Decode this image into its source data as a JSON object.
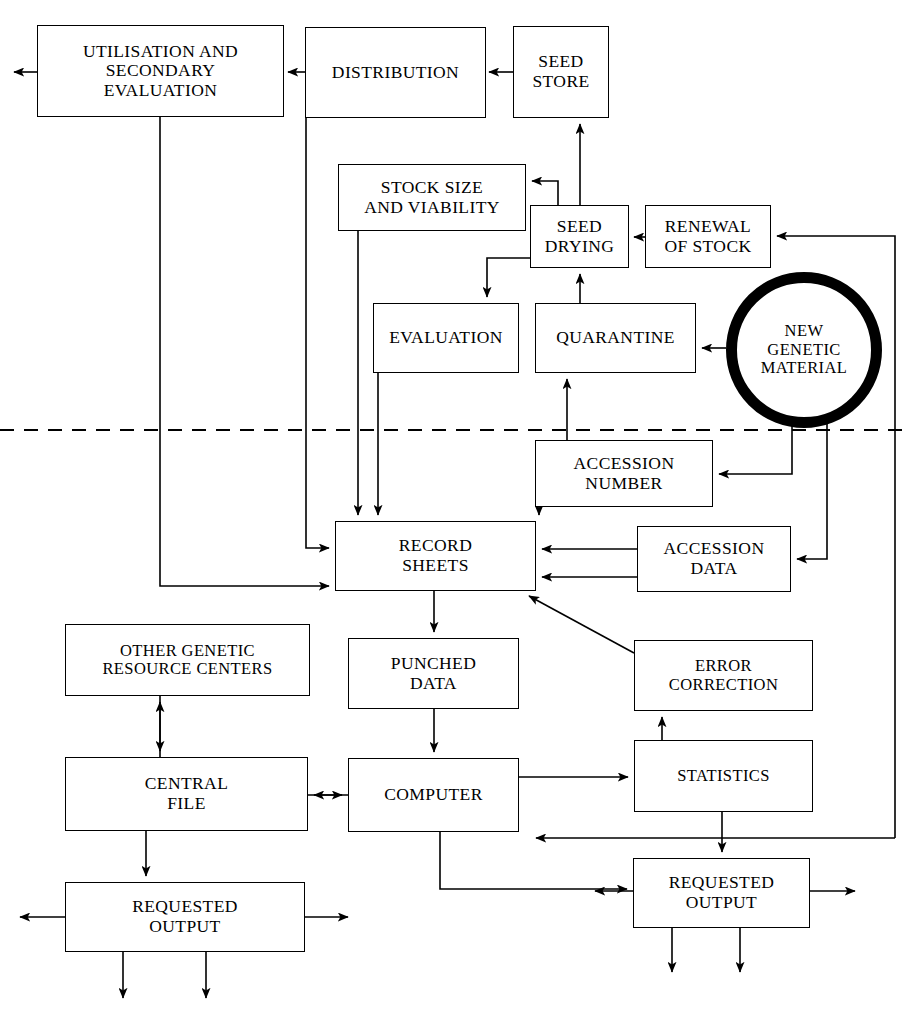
{
  "diagram": {
    "divider": {
      "name": "dashed-divider",
      "style": "dashed",
      "y": 430
    },
    "nodes": [
      {
        "id": "utilisation",
        "label": "UTILISATION AND\nSECONDARY\nEVALUATION",
        "shape": "rect",
        "x": 37,
        "y": 25,
        "w": 247,
        "h": 92
      },
      {
        "id": "distribution",
        "label": "DISTRIBUTION",
        "shape": "rect",
        "x": 305,
        "y": 27,
        "w": 181,
        "h": 91
      },
      {
        "id": "seed-store",
        "label": "SEED\nSTORE",
        "shape": "rect",
        "x": 513,
        "y": 26,
        "w": 96,
        "h": 92
      },
      {
        "id": "stock-size",
        "label": "STOCK SIZE\nAND VIABILITY",
        "shape": "rect",
        "x": 338,
        "y": 164,
        "w": 188,
        "h": 67
      },
      {
        "id": "seed-drying",
        "label": "SEED\nDRYING",
        "shape": "rect",
        "x": 530,
        "y": 205,
        "w": 99,
        "h": 63
      },
      {
        "id": "renewal-of-stock",
        "label": "RENEWAL\nOF STOCK",
        "shape": "rect",
        "x": 645,
        "y": 205,
        "w": 126,
        "h": 63
      },
      {
        "id": "evaluation",
        "label": "EVALUATION",
        "shape": "rect",
        "x": 373,
        "y": 303,
        "w": 146,
        "h": 70
      },
      {
        "id": "quarantine",
        "label": "QUARANTINE",
        "shape": "rect",
        "x": 535,
        "y": 303,
        "w": 161,
        "h": 70
      },
      {
        "id": "new-genetic-material",
        "label": "NEW\nGENETIC\nMATERIAL",
        "shape": "circle",
        "x": 726,
        "y": 272,
        "w": 156,
        "h": 156
      },
      {
        "id": "accession-number",
        "label": "ACCESSION\nNUMBER",
        "shape": "rect",
        "x": 535,
        "y": 440,
        "w": 178,
        "h": 67
      },
      {
        "id": "record-sheets",
        "label": "RECORD\nSHEETS",
        "shape": "rect",
        "x": 335,
        "y": 521,
        "w": 201,
        "h": 70
      },
      {
        "id": "accession-data",
        "label": "ACCESSION\nDATA",
        "shape": "rect",
        "x": 637,
        "y": 526,
        "w": 154,
        "h": 66
      },
      {
        "id": "other-genetic-resource-centers",
        "label": "OTHER GENETIC\nRESOURCE CENTERS",
        "shape": "rect",
        "x": 65,
        "y": 624,
        "w": 245,
        "h": 72
      },
      {
        "id": "punched-data",
        "label": "PUNCHED\nDATA",
        "shape": "rect",
        "x": 348,
        "y": 638,
        "w": 171,
        "h": 71
      },
      {
        "id": "error-correction",
        "label": "ERROR\nCORRECTION",
        "shape": "rect",
        "x": 634,
        "y": 640,
        "w": 179,
        "h": 71
      },
      {
        "id": "central-file",
        "label": "CENTRAL\nFILE",
        "shape": "rect",
        "x": 65,
        "y": 757,
        "w": 243,
        "h": 74
      },
      {
        "id": "computer",
        "label": "COMPUTER",
        "shape": "rect",
        "x": 348,
        "y": 758,
        "w": 171,
        "h": 74
      },
      {
        "id": "statistics",
        "label": "STATISTICS",
        "shape": "rect",
        "x": 634,
        "y": 740,
        "w": 179,
        "h": 72
      },
      {
        "id": "requested-output-left",
        "label": "REQUESTED\nOUTPUT",
        "shape": "rect",
        "x": 65,
        "y": 882,
        "w": 240,
        "h": 70
      },
      {
        "id": "requested-output-right",
        "label": "REQUESTED\nOUTPUT",
        "shape": "rect",
        "x": 633,
        "y": 858,
        "w": 177,
        "h": 70
      }
    ],
    "edges": [
      {
        "id": "seed-store-to-distribution",
        "from": "seed-store",
        "to": "distribution"
      },
      {
        "id": "distribution-to-utilisation",
        "from": "distribution",
        "to": "utilisation"
      },
      {
        "id": "utilisation-to-outside-left",
        "from": "utilisation",
        "to": "external"
      },
      {
        "id": "seed-drying-to-seed-store",
        "from": "seed-drying",
        "to": "seed-store"
      },
      {
        "id": "seed-drying-to-stock-size",
        "from": "seed-drying",
        "to": "stock-size"
      },
      {
        "id": "seed-drying-to-evaluation",
        "from": "seed-drying",
        "to": "evaluation"
      },
      {
        "id": "renewal-to-seed-drying",
        "from": "renewal-of-stock",
        "to": "seed-drying"
      },
      {
        "id": "quarantine-to-seed-drying",
        "from": "quarantine",
        "to": "seed-drying"
      },
      {
        "id": "new-material-to-quarantine",
        "from": "new-genetic-material",
        "to": "quarantine"
      },
      {
        "id": "new-material-to-accession-number",
        "from": "new-genetic-material",
        "to": "accession-number"
      },
      {
        "id": "new-material-to-accession-data",
        "from": "new-genetic-material",
        "to": "accession-data"
      },
      {
        "id": "accession-number-to-quarantine",
        "from": "accession-number",
        "to": "quarantine"
      },
      {
        "id": "accession-number-to-record-sheets",
        "from": "accession-number",
        "to": "record-sheets"
      },
      {
        "id": "accession-data-to-record-sheets",
        "from": "accession-data",
        "to": "record-sheets"
      },
      {
        "id": "stock-size-to-record-sheets",
        "from": "stock-size",
        "to": "record-sheets"
      },
      {
        "id": "evaluation-to-record-sheets",
        "from": "evaluation",
        "to": "record-sheets"
      },
      {
        "id": "distribution-to-record-sheets",
        "from": "distribution",
        "to": "record-sheets"
      },
      {
        "id": "utilisation-to-record-sheets",
        "from": "utilisation",
        "to": "record-sheets"
      },
      {
        "id": "record-sheets-to-punched-data",
        "from": "record-sheets",
        "to": "punched-data"
      },
      {
        "id": "error-correction-to-record-sheets",
        "from": "error-correction",
        "to": "record-sheets"
      },
      {
        "id": "punched-data-to-computer",
        "from": "punched-data",
        "to": "computer"
      },
      {
        "id": "computer-to-central-file",
        "from": "computer",
        "to": "central-file"
      },
      {
        "id": "central-file-to-other-centers",
        "from": "central-file",
        "to": "other-genetic-resource-centers"
      },
      {
        "id": "computer-to-statistics",
        "from": "computer",
        "to": "statistics"
      },
      {
        "id": "statistics-to-error-correction",
        "from": "statistics",
        "to": "error-correction"
      },
      {
        "id": "statistics-to-requested-output-right",
        "from": "statistics",
        "to": "requested-output-right"
      },
      {
        "id": "computer-to-requested-output-right",
        "from": "computer",
        "to": "requested-output-right"
      },
      {
        "id": "central-file-to-requested-output-left",
        "from": "central-file",
        "to": "requested-output-left"
      },
      {
        "id": "renewal-return-line",
        "from": "statistics",
        "to": "renewal-of-stock"
      }
    ]
  }
}
